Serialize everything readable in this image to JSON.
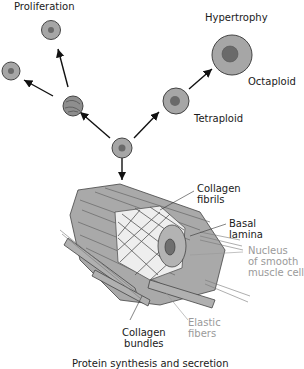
{
  "labels": {
    "proliferation": "Proliferation",
    "hypertrophy": "Hypertrophy",
    "octaploid": "Octaploid",
    "tetraploid": "Tetraploid",
    "collagen_fibrils": [
      "Collagen",
      "fibrils"
    ],
    "basal_lamina": [
      "Basal",
      "lamina"
    ],
    "nucleus": [
      "Nucleus",
      "of smooth",
      "muscle cell"
    ],
    "elastic_fibers": [
      "Elastic",
      "fibers"
    ],
    "collagen_bundles": [
      "Collagen",
      "bundles"
    ],
    "protein_synthesis": "Protein synthesis and secretion"
  },
  "colors": {
    "cytoplasm": "#9e9e9e",
    "nucleus": "#6e6e6e",
    "outline": "#333333",
    "gray_label": "#9a9a9a"
  }
}
